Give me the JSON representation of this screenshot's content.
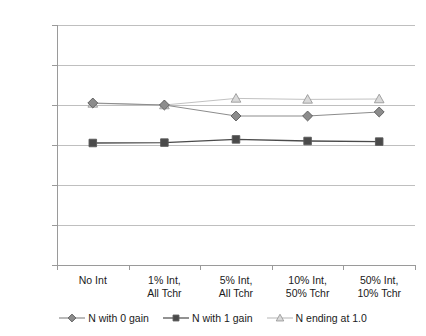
{
  "chart_data": {
    "type": "line",
    "title": "",
    "xlabel": "",
    "ylabel": "",
    "ylim": [
      0,
      1200
    ],
    "yticks": [
      0,
      200,
      400,
      600,
      800,
      1000,
      1200
    ],
    "grid": "horizontal",
    "legend_position": "bottom",
    "categories": [
      "No Int",
      "1% Int, All Tchr",
      "5% Int, All Tchr",
      "10% Int, 50% Tchr",
      "50% Int, 10% Tchr"
    ],
    "category_lines": [
      [
        "No Int"
      ],
      [
        "1% Int,",
        "All Tchr"
      ],
      [
        "5% Int,",
        "All Tchr"
      ],
      [
        "10% Int,",
        "50% Tchr"
      ],
      [
        "50% Int,",
        "10% Tchr"
      ]
    ],
    "series": [
      {
        "name": "N with 0 gain",
        "marker": "diamond",
        "color": "#8c8c8c",
        "line_color": "#8c8c8c",
        "values": [
          810,
          800,
          745,
          745,
          765
        ]
      },
      {
        "name": "N with 1 gain",
        "marker": "square",
        "color": "#4a4a4a",
        "line_color": "#4a4a4a",
        "values": [
          610,
          612,
          628,
          620,
          617
        ]
      },
      {
        "name": "N ending at 1.0",
        "marker": "triangle",
        "color": "#d9d9d9",
        "line_color": "#c2c2c2",
        "values": [
          808,
          800,
          833,
          828,
          830
        ]
      }
    ]
  },
  "axis": {
    "y_tick_labels": [
      "1200",
      "1000",
      "800",
      "600",
      "400",
      "200",
      "0"
    ]
  },
  "legend": {
    "items": [
      {
        "label": "N with 0 gain",
        "marker": "diamond-marker"
      },
      {
        "label": "N with 1 gain",
        "marker": "square-marker"
      },
      {
        "label": "N ending at 1.0",
        "marker": "triangle-marker"
      }
    ]
  }
}
